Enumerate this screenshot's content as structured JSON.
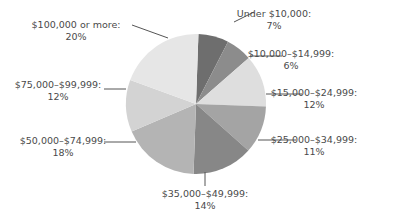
{
  "chart_data": {
    "type": "pie",
    "title": "",
    "start_angle_deg": 2,
    "direction": "clockwise",
    "slices": [
      {
        "label": "Under $10,000:",
        "pct_label": "7%",
        "value": 7,
        "color": "#6e6e6e"
      },
      {
        "label": "$10,000–$14,999:",
        "pct_label": "6%",
        "value": 6,
        "color": "#8c8c8c"
      },
      {
        "label": "$15,000–$24,999:",
        "pct_label": "12%",
        "value": 12,
        "color": "#dedede"
      },
      {
        "label": "$25,000–$34,999:",
        "pct_label": "11%",
        "value": 11,
        "color": "#a4a4a4"
      },
      {
        "label": "$35,000–$49,999:",
        "pct_label": "14%",
        "value": 14,
        "color": "#878787"
      },
      {
        "label": "$50,000–$74,999:",
        "pct_label": "18%",
        "value": 18,
        "color": "#b4b4b4"
      },
      {
        "label": "$75,000–$99,999:",
        "pct_label": "12%",
        "value": 12,
        "color": "#d3d3d3"
      },
      {
        "label": "$100,000 or more:",
        "pct_label": "20%",
        "value": 20,
        "color": "#e6e6e6"
      }
    ],
    "labels_layout": [
      {
        "x": 274,
        "y1": 17,
        "y2": 29,
        "anchor": "middle",
        "line": [
          [
            234,
            22
          ],
          [
            254,
            12
          ]
        ]
      },
      {
        "x": 291,
        "y1": 57,
        "y2": 69,
        "anchor": "middle",
        "line": [
          [
            250,
            56
          ],
          [
            282,
            56
          ]
        ]
      },
      {
        "x": 314,
        "y1": 96,
        "y2": 108,
        "anchor": "middle",
        "line": [
          [
            266,
            94
          ],
          [
            302,
            94
          ]
        ]
      },
      {
        "x": 314,
        "y1": 143,
        "y2": 155,
        "anchor": "middle",
        "line": [
          [
            258,
            140
          ],
          [
            296,
            140
          ]
        ]
      },
      {
        "x": 205,
        "y1": 197,
        "y2": 209,
        "anchor": "middle",
        "line": [
          [
            205,
            172
          ],
          [
            205,
            186
          ]
        ]
      },
      {
        "x": 63,
        "y1": 144,
        "y2": 156,
        "anchor": "middle",
        "line": [
          [
            104,
            142
          ],
          [
            136,
            142
          ]
        ]
      },
      {
        "x": 58,
        "y1": 88,
        "y2": 100,
        "anchor": "middle",
        "line": [
          [
            104,
            89
          ],
          [
            126,
            89
          ]
        ]
      },
      {
        "x": 76,
        "y1": 28,
        "y2": 40,
        "anchor": "middle",
        "line": [
          [
            132,
            25
          ],
          [
            168,
            38
          ]
        ]
      }
    ]
  }
}
